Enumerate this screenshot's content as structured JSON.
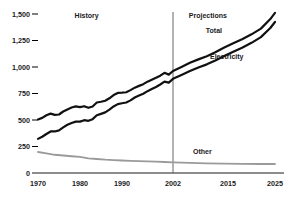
{
  "chart_data": {
    "type": "line",
    "title": "",
    "subtitle": "",
    "xlabel": "",
    "ylabel": "",
    "grid": false,
    "legend_position": "inline-annotations",
    "xlim": [
      1970,
      2025
    ],
    "ylim": [
      0,
      1500
    ],
    "yticks": [
      0,
      250,
      500,
      750,
      1000,
      1250,
      1500
    ],
    "ytick_labels": [
      "0",
      "250",
      "500",
      "750",
      "1,000",
      "1,250",
      "1,500"
    ],
    "xticks": [
      1970,
      1980,
      1990,
      2002,
      2015,
      2025
    ],
    "xtick_labels": [
      "1970",
      "1980",
      "1990",
      "2002",
      "2015",
      "2025"
    ],
    "annotations": [
      {
        "name": "history-label",
        "text": "History",
        "x": 1983,
        "y": 1480
      },
      {
        "name": "projections-label",
        "text": "Projections",
        "x": 2010,
        "y": 1480
      },
      {
        "name": "total-label",
        "text": "Total",
        "x": 2014,
        "y": 1340
      },
      {
        "name": "electricity-label",
        "text": "Electricity",
        "x": 2015,
        "y": 1090
      },
      {
        "name": "other-label",
        "text": "Other",
        "x": 2011,
        "y": 200
      }
    ],
    "divider": {
      "name": "history-projection-divider",
      "x": 2002
    },
    "series": [
      {
        "name": "Total",
        "color": "#111111",
        "x": [
          1970,
          1971,
          1972,
          1973,
          1974,
          1975,
          1976,
          1977,
          1978,
          1979,
          1980,
          1981,
          1982,
          1983,
          1984,
          1985,
          1986,
          1987,
          1988,
          1989,
          1990,
          1991,
          1992,
          1993,
          1994,
          1995,
          1996,
          1997,
          1998,
          1999,
          2000,
          2001,
          2002,
          2004,
          2006,
          2008,
          2010,
          2012,
          2014,
          2016,
          2018,
          2020,
          2022,
          2024,
          2025
        ],
        "values": [
          505,
          520,
          545,
          560,
          548,
          552,
          580,
          600,
          618,
          628,
          622,
          630,
          615,
          628,
          665,
          672,
          682,
          705,
          735,
          755,
          758,
          762,
          782,
          805,
          822,
          838,
          862,
          880,
          898,
          918,
          945,
          928,
          962,
          1000,
          1040,
          1072,
          1102,
          1140,
          1182,
          1222,
          1262,
          1308,
          1362,
          1452,
          1510
        ]
      },
      {
        "name": "Electricity",
        "color": "#111111",
        "x": [
          1970,
          1971,
          1972,
          1973,
          1974,
          1975,
          1976,
          1977,
          1978,
          1979,
          1980,
          1981,
          1982,
          1983,
          1984,
          1985,
          1986,
          1987,
          1988,
          1989,
          1990,
          1991,
          1992,
          1993,
          1994,
          1995,
          1996,
          1997,
          1998,
          1999,
          2000,
          2001,
          2002,
          2004,
          2006,
          2008,
          2010,
          2012,
          2014,
          2016,
          2018,
          2020,
          2022,
          2024,
          2025
        ],
        "values": [
          322,
          342,
          368,
          392,
          392,
          402,
          430,
          455,
          472,
          485,
          485,
          498,
          492,
          508,
          545,
          558,
          572,
          598,
          628,
          650,
          658,
          665,
          685,
          712,
          730,
          748,
          772,
          792,
          812,
          835,
          862,
          852,
          888,
          925,
          962,
          995,
          1025,
          1062,
          1102,
          1142,
          1182,
          1228,
          1282,
          1368,
          1425
        ]
      },
      {
        "name": "Other",
        "color": "#9a9a9a",
        "x": [
          1970,
          1972,
          1974,
          1976,
          1978,
          1980,
          1982,
          1984,
          1986,
          1988,
          1990,
          1992,
          1994,
          1996,
          1998,
          2000,
          2002,
          2006,
          2010,
          2014,
          2018,
          2022,
          2025
        ],
        "values": [
          198,
          185,
          172,
          165,
          158,
          152,
          138,
          132,
          126,
          122,
          118,
          115,
          112,
          110,
          108,
          104,
          100,
          95,
          90,
          88,
          86,
          85,
          85
        ]
      }
    ]
  }
}
